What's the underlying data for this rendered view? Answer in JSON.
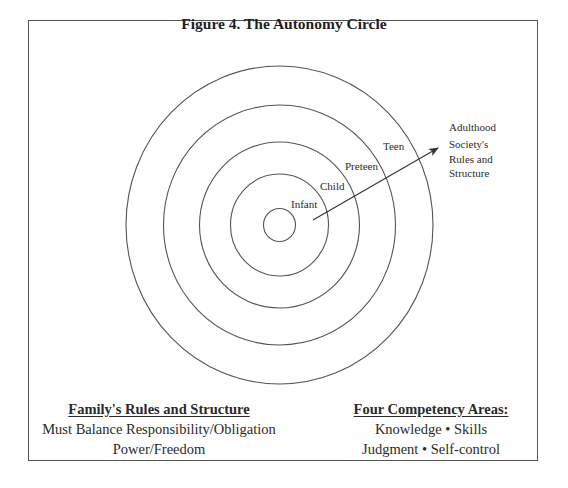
{
  "figure": {
    "title": "Figure 4. The Autonomy Circle",
    "center": {
      "cx": 279.5,
      "cy": 225
    },
    "rings": [
      {
        "rx": 16,
        "ry": 16.5
      },
      {
        "rx": 49,
        "ry": 51
      },
      {
        "rx": 80,
        "ry": 83
      },
      {
        "rx": 116,
        "ry": 120
      },
      {
        "rx": 153.5,
        "ry": 159
      }
    ],
    "stage_labels": {
      "infant": "Infant",
      "child": "Child",
      "preteen": "Preteen",
      "teen": "Teen"
    },
    "arrow": {
      "x1": 313,
      "y1": 220,
      "x2": 438,
      "y2": 148
    },
    "adulthood": {
      "label": "Adulthood",
      "line1": "Society's",
      "line2": "Rules and",
      "line3": "Structure"
    },
    "line_color": "#555555"
  },
  "family": {
    "heading": "Family's Rules and Structure",
    "line1": "Must Balance Responsibility/Obligation",
    "line2": "Power/Freedom"
  },
  "competency": {
    "heading": "Four Competency Areas:",
    "line1": "Knowledge • Skills",
    "line2": "Judgment • Self-control"
  }
}
